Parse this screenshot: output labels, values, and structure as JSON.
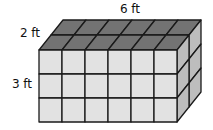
{
  "diagram": {
    "type": "rectangular-prism-unit-cubes",
    "dimensions": {
      "length_units": 6,
      "depth_units": 2,
      "height_units": 3
    },
    "labels": {
      "length": "6 ft",
      "depth": "2 ft",
      "height": "3 ft"
    },
    "colors": {
      "front": "#e2e2e2",
      "top": "#737373",
      "side": "#bdbdbd",
      "edge": "#1a1a1a"
    }
  }
}
